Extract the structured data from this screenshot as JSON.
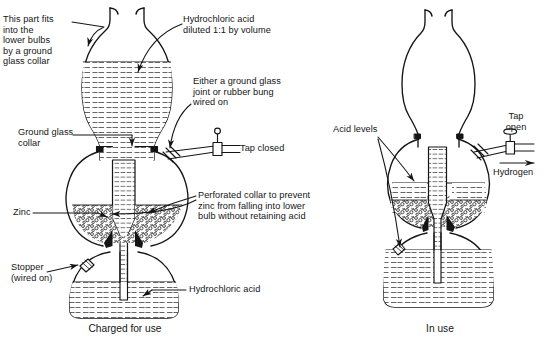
{
  "figure": {
    "captions": [
      {
        "name": "charged-for-use",
        "text": "Charged for use"
      },
      {
        "name": "in-use",
        "text": "In use"
      }
    ],
    "left_labels": {
      "this_part_fits": "This part fits\ninto the\nlower bulbs\nby a ground\nglass collar",
      "ground_glass_collar": "Ground glass\ncollar",
      "zinc": "Zinc",
      "stopper": "Stopper\n(wired on)"
    },
    "center_labels": {
      "hydrochloric_acid_diluted": "Hydrochloric acid\ndiluted 1:1 by volume",
      "either_ground_glass": "Either a ground glass\njoint or rubber bung\nwired on",
      "tap_closed": "Tap closed",
      "perforated_collar": "Perforated collar to prevent\nzinc from falling into lower\nbulb without retaining acid",
      "hydrochloric_acid": "Hydrochloric acid"
    },
    "right_labels": {
      "acid_levels": "Acid levels",
      "tap_open": "Tap\nopen",
      "hydrogen": "Hydrogen"
    },
    "colors": {
      "ink": "#151515",
      "paper": "#ffffff",
      "liquid_line": "#3c3c3c",
      "zinc_fill": "#2b2b2b"
    },
    "icon_names": [
      "tap-closed-icon",
      "tap-open-icon",
      "flow-arrow-icon",
      "leader-line",
      "zinc-granules",
      "liquid-hatching"
    ]
  }
}
